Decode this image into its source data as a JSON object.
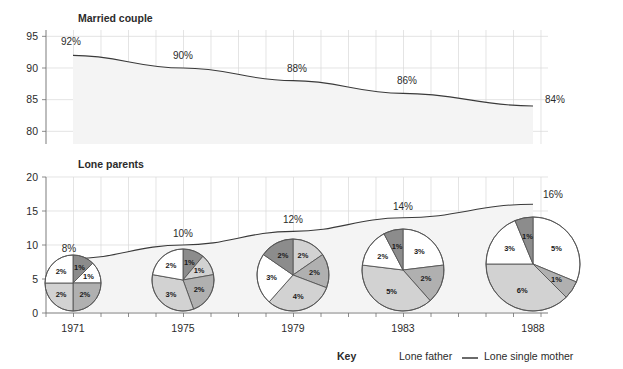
{
  "chart_data": {
    "type": "line",
    "title": "",
    "panels": [
      {
        "name": "married-couple",
        "title": "Married couple",
        "ylabel": "",
        "ylim": [
          78,
          96
        ],
        "yticks": [
          "95",
          "90",
          "85",
          "80"
        ],
        "ytick_values": [
          95,
          90,
          85,
          80
        ],
        "x": [
          "1971",
          "1975",
          "1979",
          "1983",
          "1988"
        ],
        "values": [
          92,
          90,
          88,
          86,
          84
        ],
        "point_labels": [
          "92%",
          "90%",
          "88%",
          "86%",
          "84%"
        ],
        "grid": true,
        "area_shaded": true
      },
      {
        "name": "lone-parents",
        "title": "Lone parents",
        "ylabel": "",
        "ylim": [
          0,
          20
        ],
        "yticks": [
          "20",
          "15",
          "10",
          "5",
          "0"
        ],
        "ytick_values": [
          20,
          15,
          10,
          5,
          0
        ],
        "x": [
          "1971",
          "1975",
          "1979",
          "1983",
          "1988"
        ],
        "values": [
          8,
          10,
          12,
          14,
          16
        ],
        "point_labels": [
          "8%",
          "10%",
          "12%",
          "14%",
          "16%"
        ],
        "grid": true,
        "area_shaded": true
      }
    ],
    "xlabel": "",
    "xtick_labels": [
      "1971",
      "1975",
      "1979",
      "1983",
      "1988"
    ],
    "pies": [
      {
        "year": "1971",
        "total": 8,
        "radius_px": 28,
        "slices": [
          {
            "label": "1%",
            "value": 1,
            "shade": "dark"
          },
          {
            "label": "1%",
            "value": 1,
            "shade": "white"
          },
          {
            "label": "2%",
            "value": 2,
            "shade": "medium"
          },
          {
            "label": "2%",
            "value": 2,
            "shade": "light"
          },
          {
            "label": "2%",
            "value": 2,
            "shade": "white"
          }
        ]
      },
      {
        "year": "1975",
        "total": 9,
        "radius_px": 31,
        "slices": [
          {
            "label": "1%",
            "value": 1,
            "shade": "dark"
          },
          {
            "label": "1%",
            "value": 1,
            "shade": "light"
          },
          {
            "label": "2%",
            "value": 2,
            "shade": "medium"
          },
          {
            "label": "3%",
            "value": 3,
            "shade": "light"
          },
          {
            "label": "2%",
            "value": 2,
            "shade": "white"
          }
        ]
      },
      {
        "year": "1979",
        "total": 13,
        "radius_px": 36,
        "slices": [
          {
            "label": "2%",
            "value": 2,
            "shade": "light"
          },
          {
            "label": "2%",
            "value": 2,
            "shade": "medium"
          },
          {
            "label": "4%",
            "value": 4,
            "shade": "light"
          },
          {
            "label": "3%",
            "value": 3,
            "shade": "white"
          },
          {
            "label": "2%",
            "value": 2,
            "shade": "dark"
          }
        ]
      },
      {
        "year": "1983",
        "total": 13,
        "radius_px": 41,
        "slices": [
          {
            "label": "3%",
            "value": 3,
            "shade": "white"
          },
          {
            "label": "2%",
            "value": 2,
            "shade": "medium"
          },
          {
            "label": "5%",
            "value": 5,
            "shade": "light"
          },
          {
            "label": "2%",
            "value": 2,
            "shade": "white"
          },
          {
            "label": "1%",
            "value": 1,
            "shade": "dark"
          }
        ]
      },
      {
        "year": "1988",
        "total": 16,
        "radius_px": 47,
        "slices": [
          {
            "label": "5%",
            "value": 5,
            "shade": "white"
          },
          {
            "label": "1%",
            "value": 1,
            "shade": "medium"
          },
          {
            "label": "6%",
            "value": 6,
            "shade": "light"
          },
          {
            "label": "3%",
            "value": 3,
            "shade": "white"
          },
          {
            "label": "1%",
            "value": 1,
            "shade": "dark"
          }
        ]
      }
    ],
    "legend": {
      "position": "bottom-right",
      "title": "Key",
      "entries": [
        {
          "label": "Lone father",
          "marker": "none"
        },
        {
          "label": "Lone single mother",
          "marker": "line-swatch"
        }
      ]
    },
    "colors": {
      "dark": "#8c8c8c",
      "medium": "#b0b0b0",
      "light": "#d2d2d2",
      "white": "#ffffff",
      "line": "#3a3a3a",
      "grid": "#d8d8d8",
      "axis": "#6e6e6e",
      "area": "#f4f4f4"
    }
  }
}
